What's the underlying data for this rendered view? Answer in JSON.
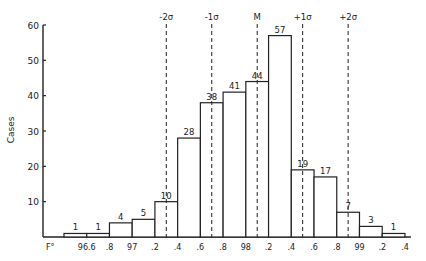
{
  "chart_data": {
    "type": "bar",
    "title": "",
    "xlabel": "F°",
    "ylabel": "Cases",
    "ylim": [
      0,
      60
    ],
    "yticks": [
      10,
      20,
      30,
      40,
      50,
      60
    ],
    "x_tick_labels": [
      "96.6",
      ".8",
      "97",
      ".2",
      ".4",
      ".6",
      ".8",
      "98",
      ".2",
      ".4",
      ".6",
      ".8",
      "99",
      ".2",
      ".4"
    ],
    "bin_edges": [
      96.4,
      96.6,
      96.8,
      97.0,
      97.2,
      97.4,
      97.6,
      97.8,
      98.0,
      98.2,
      98.4,
      98.6,
      98.8,
      99.0,
      99.2,
      99.4
    ],
    "values": [
      1,
      1,
      4,
      5,
      10,
      28,
      38,
      41,
      44,
      57,
      19,
      17,
      7,
      3,
      1
    ],
    "grid": false,
    "reference_lines": [
      {
        "label": "-2σ",
        "x": 97.3
      },
      {
        "label": "-1σ",
        "x": 97.7
      },
      {
        "label": "M",
        "x": 98.1
      },
      {
        "label": "+1σ",
        "x": 98.5
      },
      {
        "label": "+2σ",
        "x": 98.9
      }
    ],
    "legend": null
  }
}
